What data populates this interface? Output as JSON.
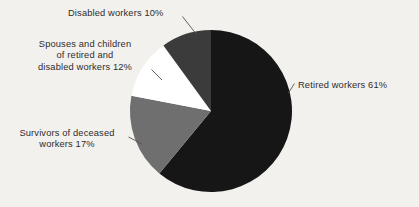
{
  "chart_data": {
    "type": "pie",
    "title": "",
    "subtitle": "",
    "xlabel": "",
    "ylabel": "",
    "grid": false,
    "legend_position": "none",
    "units": "percent",
    "start_angle_deg": 0,
    "direction": "clockwise",
    "categories": [
      "Retired workers",
      "Survivors of deceased workers",
      "Spouses and children of retired and disabled workers",
      "Disabled workers"
    ],
    "values": [
      61,
      17,
      12,
      10
    ],
    "slices": [
      {
        "name": "Retired workers",
        "value": 61,
        "value_label": "61%",
        "color": "#161616",
        "sweep_deg": 219.6,
        "start_deg": 0,
        "end_deg": 219.6
      },
      {
        "name": "Survivors of deceased workers",
        "value": 17,
        "value_label": "17%",
        "color": "#6f6f6f",
        "sweep_deg": 61.2,
        "start_deg": 219.6,
        "end_deg": 280.8
      },
      {
        "name": "Spouses and children of retired and disabled workers",
        "value": 12,
        "value_label": "12%",
        "color": "#ffffff",
        "sweep_deg": 43.2,
        "start_deg": 280.8,
        "end_deg": 324.0
      },
      {
        "name": "Disabled workers",
        "value": 10,
        "value_label": "10%",
        "color": "#3b3b3b",
        "sweep_deg": 36.0,
        "start_deg": 324.0,
        "end_deg": 360.0
      }
    ],
    "annotations": [
      {
        "id": "retired",
        "text": "Retired workers 61%",
        "lines": [
          "Retired workers 61%"
        ],
        "align": "left"
      },
      {
        "id": "survivors",
        "text": "Survivors of deceased workers 17%",
        "lines": [
          "Survivors of deceased",
          "workers 17%"
        ],
        "align": "center"
      },
      {
        "id": "spouses",
        "text": "Spouses and children of retired and disabled workers 12%",
        "lines": [
          "Spouses and children",
          "of retired and",
          "disabled workers 12%"
        ],
        "align": "center"
      },
      {
        "id": "disabled",
        "text": "Disabled workers 10%",
        "lines": [
          "Disabled workers 10%"
        ],
        "align": "left"
      }
    ]
  },
  "labels": {
    "retired": "Retired workers 61%",
    "survivors_line1": "Survivors of deceased",
    "survivors_line2": "workers 17%",
    "spouses_line1": "Spouses and children",
    "spouses_line2": "of retired and",
    "spouses_line3": "disabled workers 12%",
    "disabled": "Disabled workers 10%"
  },
  "colors": {
    "background": "#f3f1ee",
    "text": "#2e2c2b",
    "leader_line": "#55524f",
    "slice_retired": "#161616",
    "slice_survivors": "#6f6f6f",
    "slice_spouses": "#ffffff",
    "slice_disabled": "#3b3b3b"
  }
}
